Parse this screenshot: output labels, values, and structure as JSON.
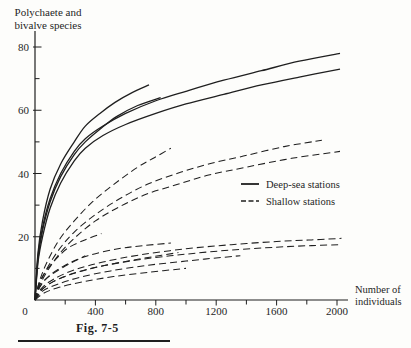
{
  "figure": {
    "y_axis_title_line1": "Polychaete and",
    "y_axis_title_line2": "bivalve species",
    "x_axis_title_line1": "Number of",
    "x_axis_title_line2": "individuals",
    "origin_label": "0",
    "caption": "Fig. 7-5"
  },
  "legend": {
    "deep_label": "Deep-sea stations",
    "shallow_label": "Shallow stations"
  },
  "colors": {
    "ink": "#1f1f1f",
    "paper": "#fdfdfb"
  },
  "chart_data": {
    "type": "line",
    "title": "",
    "xlabel": "Number of individuals",
    "ylabel": "Polychaete and bivalve species",
    "xlim": [
      0,
      2065
    ],
    "ylim": [
      0,
      85
    ],
    "grid": false,
    "legend_position": "right-middle",
    "x_major_ticks": [
      400,
      800,
      1200,
      1600,
      2000
    ],
    "x_minor_ticks": [
      200,
      600,
      1000,
      1400,
      1800
    ],
    "y_major_ticks": [
      20,
      40,
      60,
      80
    ],
    "y_minor_ticks": [
      10,
      30,
      50,
      70
    ],
    "series": [
      {
        "name": "deep-sea-1",
        "group": "deep-sea",
        "style": "solid",
        "points": [
          [
            0,
            0
          ],
          [
            20,
            14
          ],
          [
            50,
            23
          ],
          [
            100,
            32
          ],
          [
            170,
            40
          ],
          [
            260,
            47
          ],
          [
            333,
            51
          ],
          [
            450,
            55
          ],
          [
            600,
            59
          ],
          [
            800,
            63
          ],
          [
            1000,
            66
          ],
          [
            1250,
            69.5
          ],
          [
            1500,
            72.5
          ],
          [
            1750,
            75.5
          ],
          [
            2020,
            78
          ]
        ]
      },
      {
        "name": "deep-sea-2",
        "group": "deep-sea",
        "style": "solid",
        "points": [
          [
            0,
            0
          ],
          [
            20,
            12
          ],
          [
            50,
            20
          ],
          [
            100,
            29
          ],
          [
            170,
            37
          ],
          [
            260,
            44
          ],
          [
            333,
            48
          ],
          [
            450,
            52
          ],
          [
            600,
            55.5
          ],
          [
            800,
            59
          ],
          [
            1000,
            62
          ],
          [
            1250,
            65
          ],
          [
            1500,
            68
          ],
          [
            1750,
            70.5
          ],
          [
            2020,
            73
          ]
        ]
      },
      {
        "name": "deep-sea-3",
        "group": "deep-sea",
        "style": "solid",
        "points": [
          [
            0,
            0
          ],
          [
            20,
            15
          ],
          [
            50,
            25
          ],
          [
            100,
            35
          ],
          [
            170,
            43
          ],
          [
            260,
            50
          ],
          [
            333,
            55
          ],
          [
            430,
            59
          ],
          [
            530,
            62.5
          ],
          [
            640,
            65.5
          ],
          [
            755,
            68
          ]
        ]
      },
      {
        "name": "deep-sea-4",
        "group": "deep-sea",
        "style": "solid",
        "points": [
          [
            0,
            0
          ],
          [
            20,
            13
          ],
          [
            50,
            22
          ],
          [
            100,
            31
          ],
          [
            170,
            39
          ],
          [
            260,
            46
          ],
          [
            333,
            50
          ],
          [
            430,
            54
          ],
          [
            540,
            58
          ],
          [
            680,
            61.5
          ],
          [
            832,
            64
          ]
        ]
      },
      {
        "name": "shallow-1",
        "group": "shallow",
        "style": "dashed",
        "points": [
          [
            0,
            0
          ],
          [
            30,
            6
          ],
          [
            80,
            12
          ],
          [
            160,
            19
          ],
          [
            260,
            25
          ],
          [
            380,
            31
          ],
          [
            520,
            36.5
          ],
          [
            680,
            42
          ],
          [
            790,
            45
          ],
          [
            900,
            48
          ]
        ]
      },
      {
        "name": "shallow-2",
        "group": "shallow",
        "style": "dashed",
        "points": [
          [
            0,
            0
          ],
          [
            30,
            5
          ],
          [
            80,
            10
          ],
          [
            160,
            16
          ],
          [
            260,
            21.5
          ],
          [
            400,
            27
          ],
          [
            560,
            32
          ],
          [
            740,
            36.5
          ],
          [
            940,
            40
          ],
          [
            1150,
            43
          ],
          [
            1380,
            45.5
          ],
          [
            1650,
            48.5
          ],
          [
            1900,
            50.5
          ]
        ]
      },
      {
        "name": "shallow-3",
        "group": "shallow",
        "style": "dashed",
        "points": [
          [
            0,
            0
          ],
          [
            30,
            4.5
          ],
          [
            80,
            9
          ],
          [
            160,
            14.5
          ],
          [
            260,
            19.5
          ],
          [
            400,
            25
          ],
          [
            560,
            29.5
          ],
          [
            740,
            33.5
          ],
          [
            940,
            36.5
          ],
          [
            1150,
            39.5
          ],
          [
            1400,
            42
          ],
          [
            1700,
            44.8
          ],
          [
            2020,
            47
          ]
        ]
      },
      {
        "name": "shallow-4",
        "group": "shallow",
        "style": "dashed",
        "points": [
          [
            0,
            0
          ],
          [
            25,
            5
          ],
          [
            70,
            9
          ],
          [
            140,
            13
          ],
          [
            220,
            16.5
          ],
          [
            330,
            19
          ],
          [
            440,
            21
          ]
        ]
      },
      {
        "name": "shallow-5",
        "group": "shallow",
        "style": "dashed",
        "points": [
          [
            0,
            0
          ],
          [
            30,
            4
          ],
          [
            90,
            7.5
          ],
          [
            200,
            11
          ],
          [
            350,
            14
          ],
          [
            550,
            16.2
          ],
          [
            720,
            17.2
          ],
          [
            900,
            18
          ]
        ]
      },
      {
        "name": "shallow-6",
        "group": "shallow",
        "style": "dashed",
        "points": [
          [
            0,
            0
          ],
          [
            40,
            3.5
          ],
          [
            120,
            6.5
          ],
          [
            260,
            9.5
          ],
          [
            450,
            12
          ],
          [
            700,
            14.3
          ],
          [
            1000,
            16.2
          ],
          [
            1300,
            17.5
          ],
          [
            1600,
            18.5
          ],
          [
            1830,
            19
          ],
          [
            2030,
            19.5
          ]
        ]
      },
      {
        "name": "shallow-7",
        "group": "shallow",
        "style": "dashed",
        "points": [
          [
            0,
            0
          ],
          [
            40,
            3
          ],
          [
            120,
            5.8
          ],
          [
            260,
            8.5
          ],
          [
            450,
            10.8
          ],
          [
            700,
            12.8
          ],
          [
            1000,
            14.5
          ],
          [
            1300,
            15.8
          ],
          [
            1600,
            16.7
          ],
          [
            1830,
            17.2
          ],
          [
            2030,
            17.5
          ]
        ]
      },
      {
        "name": "shallow-8",
        "group": "shallow",
        "style": "dashed",
        "points": [
          [
            0,
            0
          ],
          [
            40,
            3
          ],
          [
            110,
            5.5
          ],
          [
            230,
            8
          ],
          [
            400,
            10.3
          ],
          [
            600,
            12.2
          ],
          [
            780,
            13.7
          ],
          [
            950,
            15
          ]
        ]
      },
      {
        "name": "shallow-9",
        "group": "shallow",
        "style": "dashed",
        "points": [
          [
            0,
            0
          ],
          [
            50,
            2.8
          ],
          [
            150,
            5
          ],
          [
            300,
            7.2
          ],
          [
            500,
            9.2
          ],
          [
            750,
            11
          ],
          [
            1000,
            12.3
          ],
          [
            1180,
            13.2
          ],
          [
            1360,
            14
          ]
        ]
      },
      {
        "name": "shallow-10",
        "group": "shallow",
        "style": "dashed",
        "points": [
          [
            0,
            0
          ],
          [
            25,
            3.5
          ],
          [
            70,
            6.5
          ],
          [
            140,
            9
          ],
          [
            230,
            11.5
          ],
          [
            333,
            14
          ]
        ]
      },
      {
        "name": "shallow-11",
        "group": "shallow",
        "style": "dashed",
        "points": [
          [
            0,
            0
          ],
          [
            60,
            2.2
          ],
          [
            160,
            4
          ],
          [
            320,
            5.8
          ],
          [
            520,
            7.4
          ],
          [
            760,
            8.8
          ],
          [
            1000,
            10
          ]
        ]
      }
    ]
  }
}
